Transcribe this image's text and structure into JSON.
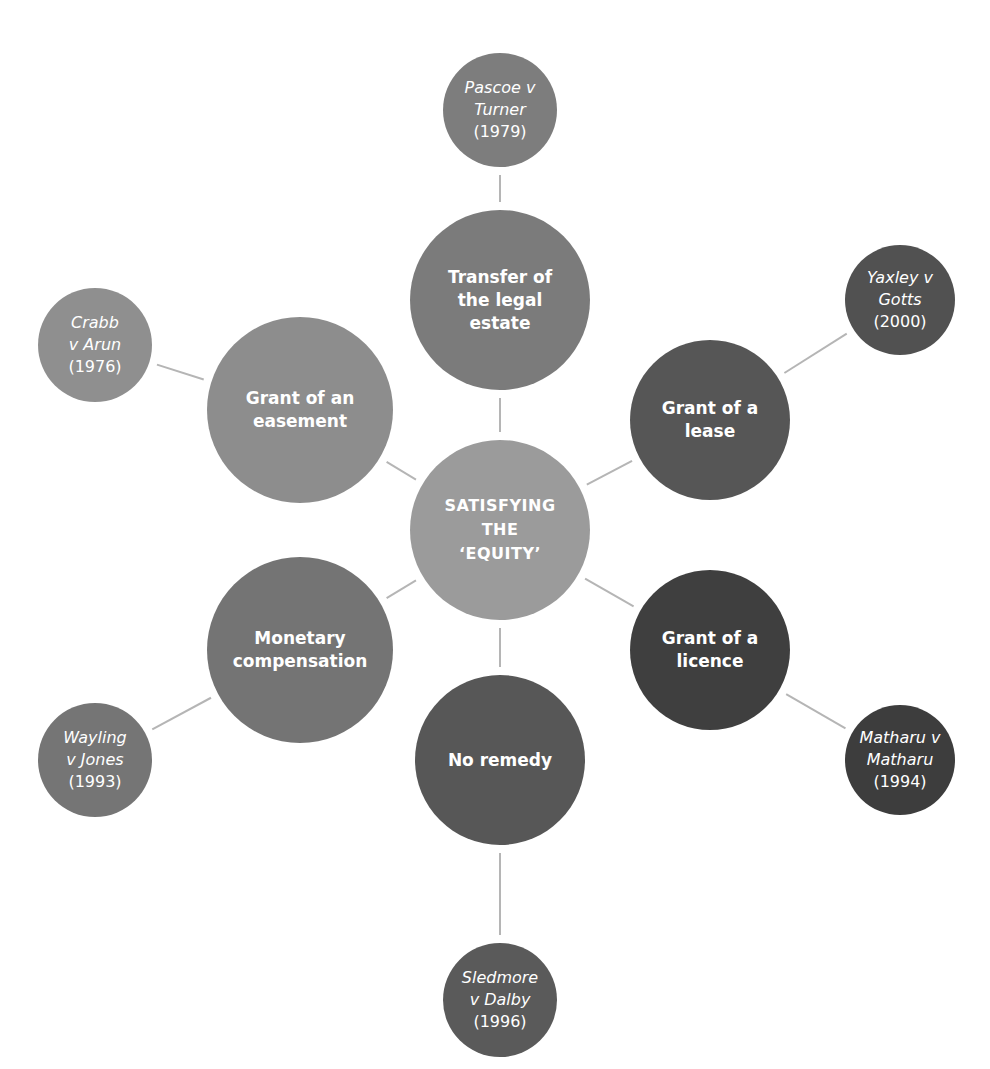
{
  "center": {
    "label": "SATISFYING\nTHE\n‘EQUITY’",
    "color": "#9b9b9b",
    "x": 500,
    "y": 530,
    "r": 90
  },
  "remedies": [
    {
      "id": "transfer",
      "label": "Transfer of\nthe legal\nestate",
      "color": "#7b7b7b",
      "x": 500,
      "y": 300,
      "r": 90,
      "case": {
        "name": "Pascoe v\nTurner",
        "year": "(1979)",
        "color": "#7d7d7d",
        "x": 500,
        "y": 110,
        "r": 57
      }
    },
    {
      "id": "lease",
      "label": "Grant of a\nlease",
      "color": "#565656",
      "x": 710,
      "y": 420,
      "r": 80,
      "case": {
        "name": "Yaxley v\nGotts",
        "year": "(2000)",
        "color": "#515151",
        "x": 900,
        "y": 300,
        "r": 55
      }
    },
    {
      "id": "licence",
      "label": "Grant of a\nlicence",
      "color": "#3f3f3f",
      "x": 710,
      "y": 650,
      "r": 80,
      "case": {
        "name": "Matharu v\nMatharu",
        "year": "(1994)",
        "color": "#3d3d3d",
        "x": 900,
        "y": 760,
        "r": 55
      }
    },
    {
      "id": "no-remedy",
      "label": "No remedy",
      "color": "#575757",
      "x": 500,
      "y": 760,
      "r": 85,
      "case": {
        "name": "Sledmore\nv Dalby",
        "year": "(1996)",
        "color": "#5a5a5a",
        "x": 500,
        "y": 1000,
        "r": 57
      }
    },
    {
      "id": "monetary",
      "label": "Monetary\ncompensation",
      "color": "#747474",
      "x": 300,
      "y": 650,
      "r": 93,
      "case": {
        "name": "Wayling\nv Jones",
        "year": "(1993)",
        "color": "#757575",
        "x": 95,
        "y": 760,
        "r": 57
      }
    },
    {
      "id": "easement",
      "label": "Grant of an\neasement",
      "color": "#8d8d8d",
      "x": 300,
      "y": 410,
      "r": 93,
      "case": {
        "name": "Crabb\nv Arun",
        "year": "(1976)",
        "color": "#8f8f8f",
        "x": 95,
        "y": 345,
        "r": 57
      }
    }
  ],
  "connector_color": "#b5b5b5"
}
